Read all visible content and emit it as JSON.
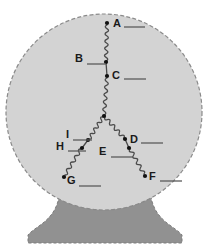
{
  "figure": {
    "colors": {
      "background": "#ffffff",
      "circle_fill": "#d3d3d3",
      "circle_stroke": "#8a8a8a",
      "base_fill": "#919191",
      "base_stroke": "#7d7d7d",
      "wire": "#4a4a4a",
      "node": "#111111",
      "label_text": "#1a1a1a",
      "leader_line": "#5a5a5a"
    },
    "circle": {
      "cx": 104,
      "cy": 112,
      "r": 98,
      "dashed": true
    },
    "base": {
      "top_y": 186,
      "bottom_y": 243,
      "top_left_x": 60,
      "top_right_x": 150,
      "bottom_left_x": 28,
      "bottom_right_x": 182,
      "dashed": true
    }
  },
  "labels": [
    {
      "id": "A",
      "text": "A",
      "tx": 113,
      "ty": 27,
      "dot_x": 107,
      "dot_y": 23,
      "leader": {
        "x1": 124,
        "y1": 27,
        "x2": 145,
        "y2": 27
      }
    },
    {
      "id": "B",
      "text": "B",
      "tx": 75,
      "ty": 62,
      "dot_x": 106,
      "dot_y": 62,
      "leader": {
        "x1": 87,
        "y1": 64,
        "x2": 106,
        "y2": 64
      }
    },
    {
      "id": "C",
      "text": "C",
      "tx": 112,
      "ty": 79,
      "dot_x": 107,
      "dot_y": 76,
      "leader": {
        "x1": 124,
        "y1": 79,
        "x2": 146,
        "y2": 79
      }
    },
    {
      "id": "D",
      "text": "D",
      "tx": 130,
      "ty": 143,
      "dot_x": 125,
      "dot_y": 139,
      "leader": {
        "x1": 141,
        "y1": 143,
        "x2": 163,
        "y2": 143
      }
    },
    {
      "id": "E",
      "text": "E",
      "tx": 99,
      "ty": 155,
      "dot_x": 129,
      "dot_y": 148,
      "leader": {
        "x1": 111,
        "y1": 157,
        "x2": 133,
        "y2": 157
      }
    },
    {
      "id": "F",
      "text": "F",
      "tx": 149,
      "ty": 180,
      "dot_x": 145,
      "dot_y": 176,
      "leader": {
        "x1": 160,
        "y1": 181,
        "x2": 182,
        "y2": 181
      }
    },
    {
      "id": "G",
      "text": "G",
      "tx": 67,
      "ty": 184,
      "dot_x": 64,
      "dot_y": 177,
      "leader": {
        "x1": 79,
        "y1": 186,
        "x2": 101,
        "y2": 186
      }
    },
    {
      "id": "H",
      "text": "H",
      "tx": 56,
      "ty": 150,
      "dot_x": 82,
      "dot_y": 148,
      "leader": {
        "x1": 68,
        "y1": 151,
        "x2": 86,
        "y2": 151
      }
    },
    {
      "id": "I",
      "text": "I",
      "tx": 66,
      "ty": 138,
      "dot_x": 88,
      "dot_y": 140,
      "leader": {
        "x1": 73,
        "y1": 140,
        "x2": 92,
        "y2": 140
      }
    }
  ],
  "nodes": [
    {
      "name": "terminal-a",
      "x": 107,
      "y": 23
    },
    {
      "name": "tap-b",
      "x": 106,
      "y": 62
    },
    {
      "name": "tap-c",
      "x": 107,
      "y": 76
    },
    {
      "name": "apex",
      "x": 104,
      "y": 116
    },
    {
      "name": "tap-i",
      "x": 88,
      "y": 140
    },
    {
      "name": "tap-h",
      "x": 82,
      "y": 148
    },
    {
      "name": "terminal-g",
      "x": 64,
      "y": 177
    },
    {
      "name": "tap-d",
      "x": 125,
      "y": 139
    },
    {
      "name": "tap-e",
      "x": 129,
      "y": 148
    },
    {
      "name": "terminal-f",
      "x": 145,
      "y": 176
    }
  ],
  "coils": [
    {
      "name": "coil-a-b",
      "x1": 107,
      "y1": 25,
      "x2": 106,
      "y2": 61,
      "loops": 5
    },
    {
      "name": "coil-c-apex",
      "x1": 107,
      "y1": 78,
      "x2": 104,
      "y2": 115,
      "loops": 5
    },
    {
      "name": "coil-apex-i",
      "x1": 103,
      "y1": 117,
      "x2": 89,
      "y2": 139,
      "loops": 4
    },
    {
      "name": "coil-h-g",
      "x1": 81,
      "y1": 149,
      "x2": 65,
      "y2": 175,
      "loops": 4
    },
    {
      "name": "coil-apex-d",
      "x1": 105,
      "y1": 117,
      "x2": 124,
      "y2": 138,
      "loops": 4
    },
    {
      "name": "coil-e-f",
      "x1": 130,
      "y1": 149,
      "x2": 144,
      "y2": 174,
      "loops": 4
    }
  ],
  "segments": [
    {
      "name": "seg-b-c",
      "x1": 106,
      "y1": 62,
      "x2": 107,
      "y2": 76
    },
    {
      "name": "seg-i-h",
      "x1": 88,
      "y1": 140,
      "x2": 82,
      "y2": 148
    },
    {
      "name": "seg-d-e",
      "x1": 125,
      "y1": 139,
      "x2": 129,
      "y2": 148
    }
  ]
}
